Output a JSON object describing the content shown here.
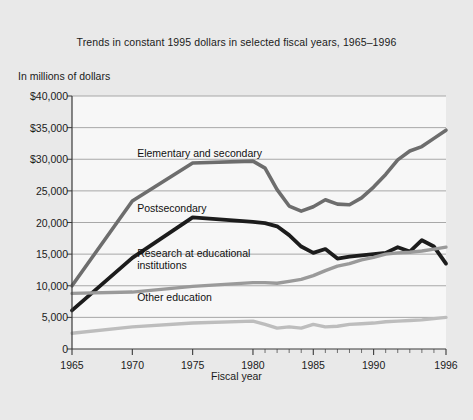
{
  "chart_data": {
    "type": "line",
    "title": "Trends in constant 1995 dollars in selected fiscal years, 1965–1996",
    "ylabel": "In millions of dollars",
    "xlabel": "Fiscal year",
    "ylim": [
      0,
      40000
    ],
    "xlim": [
      1965,
      1996
    ],
    "grid": true,
    "legend_position": "inline-annotations",
    "ytick_labels": [
      "$40,000",
      "$35,000",
      "$30,000",
      "25,000",
      "20,000",
      "15,000",
      "10,000",
      "5,000",
      "0"
    ],
    "ytick_values": [
      40000,
      35000,
      30000,
      25000,
      20000,
      15000,
      10000,
      5000,
      0
    ],
    "xtick_labels": [
      "1965",
      "1970",
      "1975",
      "1980",
      "1985",
      "1990",
      "1996"
    ],
    "xtick_values": [
      1965,
      1970,
      1975,
      1980,
      1985,
      1990,
      1996
    ],
    "minor_xticks": [
      1981,
      1982,
      1983,
      1984,
      1986,
      1987,
      1988,
      1989,
      1991,
      1992,
      1993,
      1994,
      1995
    ],
    "x": [
      1965,
      1970,
      1975,
      1980,
      1981,
      1982,
      1983,
      1984,
      1985,
      1986,
      1987,
      1988,
      1989,
      1990,
      1991,
      1992,
      1993,
      1994,
      1995,
      1996
    ],
    "series": [
      {
        "name": "Elementary and secondary",
        "color": "#6d6d6d",
        "width": 3.6,
        "values": [
          10000,
          23400,
          29400,
          29700,
          28600,
          25200,
          22600,
          21800,
          22500,
          23600,
          22900,
          22800,
          23900,
          25600,
          27600,
          29900,
          31300,
          32000,
          33300,
          34600
        ]
      },
      {
        "name": "Postsecondary",
        "color": "#1c1c1c",
        "width": 3.8,
        "values": [
          6100,
          14400,
          20800,
          20100,
          19900,
          19400,
          18000,
          16200,
          15200,
          15800,
          14300,
          14600,
          14800,
          15000,
          15200,
          16100,
          15400,
          17200,
          16200,
          13500
        ]
      },
      {
        "name": "Research at educational\ninstitutions",
        "color": "#9a9a9a",
        "width": 3.4,
        "values": [
          8800,
          9000,
          9900,
          10500,
          10500,
          10400,
          10700,
          11000,
          11600,
          12400,
          13100,
          13500,
          14100,
          14500,
          15000,
          15200,
          15300,
          15500,
          15800,
          16100
        ]
      },
      {
        "name": "Other education",
        "color": "#bdbdbd",
        "width": 3.4,
        "values": [
          2500,
          3500,
          4100,
          4400,
          3900,
          3300,
          3500,
          3300,
          3900,
          3500,
          3600,
          3900,
          4000,
          4100,
          4300,
          4400,
          4500,
          4600,
          4800,
          5000
        ]
      }
    ],
    "annotations": [
      {
        "text": "Elementary and secondary",
        "x": 1970.4,
        "y": 31900
      },
      {
        "text": "Postsecondary",
        "x": 1970.4,
        "y": 23300
      },
      {
        "text": "Research at educational\ninstitutions",
        "x": 1970.4,
        "y": 16100
      },
      {
        "text": "Other education",
        "x": 1970.4,
        "y": 9200
      }
    ],
    "colors": {
      "background": "#e9e9e9",
      "plot_background": "#f7f7f7",
      "gridline": "#9e9e9e",
      "axis": "#3a3a3a",
      "text": "#1b1b1b"
    }
  }
}
